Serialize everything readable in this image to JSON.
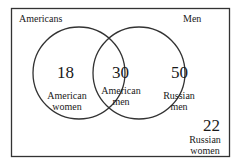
{
  "diagram": {
    "type": "venn",
    "sets": [
      {
        "name": "Americans"
      },
      {
        "name": "Men"
      }
    ],
    "regions": [
      {
        "id": "americans-only",
        "value": "18",
        "label_line1": "American",
        "label_line2": "women"
      },
      {
        "id": "intersection",
        "value": "30",
        "label_line1": "American",
        "label_line2": "men"
      },
      {
        "id": "men-only",
        "value": "50",
        "label_line1": "Russian",
        "label_line2": "men"
      },
      {
        "id": "outside",
        "value": "22",
        "label_line1": "Russian",
        "label_line2": "women"
      }
    ],
    "colors": {
      "stroke": "#333333",
      "background": "#ffffff"
    }
  }
}
